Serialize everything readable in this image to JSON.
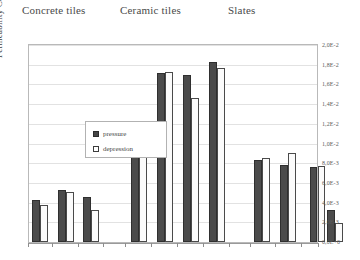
{
  "chart_data": {
    "type": "bar",
    "title": "",
    "xlabel": "",
    "ylabel": "Permeability Coefficient Φ",
    "ylim": [
      0,
      0.02
    ],
    "grid": true,
    "legend_position": "upper-left-inside",
    "y_axis_position": "right",
    "tick_labels": [
      "2,0E-2",
      "1,8E-2",
      "1,6E-2",
      "1,4E-2",
      "1,2E-2",
      "1,0E-2",
      "8,0E-3",
      "6,0E-3",
      "4,0E-3",
      "2,0E-3",
      "0,0E+0"
    ],
    "tick_values": [
      0.02,
      0.018,
      0.016,
      0.014,
      0.012,
      0.01,
      0.008,
      0.006,
      0.004,
      0.002,
      0
    ],
    "group_labels": [
      "Concrete tiles",
      "Ceramic tiles",
      "Slates"
    ],
    "legend": [
      {
        "name": "pressure",
        "color": "#4b4b4b"
      },
      {
        "name": "depression",
        "color": "#fbfbfb"
      }
    ],
    "series": [
      {
        "name": "pressure",
        "values": [
          0.0043,
          0.0053,
          0.0046,
          0.0113,
          0.0172,
          0.017,
          0.0183,
          0.0083,
          0.0078,
          0.0076,
          0.0032
        ]
      },
      {
        "name": "depression",
        "values": [
          0.0038,
          0.0051,
          0.0032,
          0.0106,
          0.0173,
          0.0146,
          0.0177,
          0.0085,
          0.009,
          0.0077,
          0.0019
        ]
      }
    ],
    "groups": [
      {
        "label": "Concrete tiles",
        "sample_indices": [
          0,
          1,
          2
        ]
      },
      {
        "label": "Ceramic tiles",
        "sample_indices": [
          3,
          4,
          5,
          6
        ]
      },
      {
        "label": "Slates",
        "sample_indices": [
          7,
          8,
          9,
          10
        ]
      }
    ]
  }
}
